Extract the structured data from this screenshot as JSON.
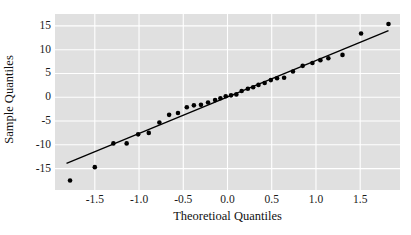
{
  "chart_data": {
    "type": "scatter",
    "title": "",
    "xlabel": "Theoretioal Quantiles",
    "ylabel": "Sample Quantiles",
    "xlim": [
      -1.95,
      1.95
    ],
    "ylim": [
      -19.5,
      17.5
    ],
    "xticks": [
      -1.5,
      -1.0,
      -0.5,
      0.0,
      0.5,
      1.0,
      1.5
    ],
    "xticklabels": [
      "-1.5",
      "-1.0",
      "-0.5",
      "0.0",
      "0.5",
      "1.0",
      "1.5"
    ],
    "yticks": [
      15,
      10,
      5,
      0,
      -5,
      -10,
      -15
    ],
    "yticklabels": [
      "15",
      "10",
      "5",
      "0",
      "-5",
      "-10",
      "-15"
    ],
    "grid": true,
    "grid_color": "#ffffff",
    "panel_color": "#e0e0e0",
    "point_color": "#000000",
    "line_color": "#000000",
    "legend": null,
    "reference_line": {
      "x": [
        -1.82,
        1.82
      ],
      "y": [
        -13.9,
        14.0
      ]
    },
    "points": [
      {
        "x": -1.78,
        "y": -17.5
      },
      {
        "x": -1.5,
        "y": -14.7
      },
      {
        "x": -1.29,
        "y": -9.7
      },
      {
        "x": -1.14,
        "y": -9.7
      },
      {
        "x": -1.01,
        "y": -7.8
      },
      {
        "x": -0.89,
        "y": -7.5
      },
      {
        "x": -0.77,
        "y": -5.3
      },
      {
        "x": -0.66,
        "y": -3.7
      },
      {
        "x": -0.56,
        "y": -3.3
      },
      {
        "x": -0.46,
        "y": -2.1
      },
      {
        "x": -0.38,
        "y": -1.7
      },
      {
        "x": -0.3,
        "y": -1.6
      },
      {
        "x": -0.22,
        "y": -1.1
      },
      {
        "x": -0.14,
        "y": -0.6
      },
      {
        "x": -0.08,
        "y": -0.2
      },
      {
        "x": -0.02,
        "y": 0.2
      },
      {
        "x": 0.04,
        "y": 0.4
      },
      {
        "x": 0.1,
        "y": 0.6
      },
      {
        "x": 0.16,
        "y": 1.3
      },
      {
        "x": 0.23,
        "y": 1.8
      },
      {
        "x": 0.29,
        "y": 2.1
      },
      {
        "x": 0.35,
        "y": 2.6
      },
      {
        "x": 0.42,
        "y": 3.0
      },
      {
        "x": 0.49,
        "y": 3.6
      },
      {
        "x": 0.56,
        "y": 4.0
      },
      {
        "x": 0.64,
        "y": 4.1
      },
      {
        "x": 0.74,
        "y": 5.4
      },
      {
        "x": 0.85,
        "y": 6.6
      },
      {
        "x": 0.96,
        "y": 7.2
      },
      {
        "x": 1.05,
        "y": 7.8
      },
      {
        "x": 1.14,
        "y": 8.2
      },
      {
        "x": 1.3,
        "y": 8.9
      },
      {
        "x": 1.51,
        "y": 13.4
      },
      {
        "x": 1.82,
        "y": 15.4
      }
    ]
  }
}
